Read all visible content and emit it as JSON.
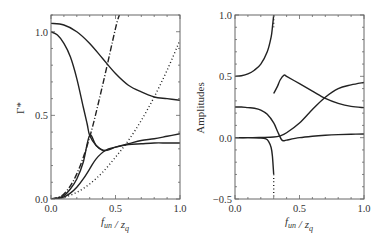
{
  "chart_data": [
    {
      "type": "line",
      "panel": "left",
      "xlabel": "f_un / z_q",
      "ylabel": "Γ*",
      "xlim": [
        0,
        1.0
      ],
      "ylim": [
        0,
        1.1
      ],
      "xticks": [
        "0.0",
        "0.5",
        "1.0"
      ],
      "yticks": [
        "0.0",
        "0.5",
        "1.0"
      ],
      "xtick_values": [
        0,
        0.5,
        1.0
      ],
      "ytick_values": [
        0,
        0.5,
        1.0
      ],
      "grid": false,
      "series": [
        {
          "name": "upper-solid",
          "style": "solid",
          "x": [
            0,
            0.1,
            0.2,
            0.3,
            0.4,
            0.5,
            0.6,
            0.7,
            0.8,
            0.9,
            1.0
          ],
          "y": [
            1.05,
            1.04,
            1.0,
            0.93,
            0.84,
            0.75,
            0.68,
            0.64,
            0.61,
            0.6,
            0.59
          ]
        },
        {
          "name": "falling-solid",
          "style": "solid",
          "x": [
            0,
            0.05,
            0.1,
            0.15,
            0.2,
            0.25,
            0.28,
            0.3,
            0.35,
            0.4,
            0.42
          ],
          "y": [
            1.0,
            0.98,
            0.93,
            0.85,
            0.72,
            0.55,
            0.45,
            0.38,
            0.32,
            0.29,
            0.29
          ]
        },
        {
          "name": "rising-solid-a",
          "style": "solid",
          "x": [
            0,
            0.05,
            0.1,
            0.15,
            0.2,
            0.25,
            0.3,
            0.35,
            0.42,
            0.5,
            0.6,
            0.7,
            0.8,
            0.9,
            1.0
          ],
          "y": [
            0,
            0.005,
            0.02,
            0.06,
            0.12,
            0.22,
            0.38,
            0.32,
            0.29,
            0.31,
            0.33,
            0.35,
            0.36,
            0.375,
            0.39
          ]
        },
        {
          "name": "rising-solid-b",
          "style": "solid",
          "x": [
            0,
            0.05,
            0.1,
            0.15,
            0.2,
            0.25,
            0.3,
            0.35,
            0.42,
            0.5,
            0.6,
            0.7,
            0.8,
            0.9,
            1.0
          ],
          "y": [
            0,
            0.003,
            0.012,
            0.035,
            0.07,
            0.12,
            0.18,
            0.24,
            0.29,
            0.31,
            0.325,
            0.33,
            0.335,
            0.335,
            0.335
          ]
        },
        {
          "name": "dash-dot",
          "style": "dashdot",
          "x": [
            0,
            0.1,
            0.2,
            0.3,
            0.4,
            0.5,
            0.53
          ],
          "y": [
            0,
            0.03,
            0.15,
            0.37,
            0.68,
            1.02,
            1.1
          ]
        },
        {
          "name": "dotted",
          "style": "dotted",
          "x": [
            0,
            0.1,
            0.2,
            0.3,
            0.4,
            0.5,
            0.6,
            0.7,
            0.8,
            0.9,
            1.0
          ],
          "y": [
            0,
            0.01,
            0.04,
            0.09,
            0.16,
            0.25,
            0.35,
            0.47,
            0.61,
            0.77,
            0.95
          ]
        }
      ]
    },
    {
      "type": "line",
      "panel": "right",
      "xlabel": "f_un / z_q",
      "ylabel": "Amplitudes",
      "xlim": [
        0,
        1.0
      ],
      "ylim": [
        -0.5,
        1.0
      ],
      "xticks": [
        "0.0",
        "0.5",
        "1.0"
      ],
      "yticks": [
        "−0.5",
        "0.0",
        "0.5",
        "1.0"
      ],
      "xtick_values": [
        0,
        0.5,
        1.0
      ],
      "ytick_values": [
        -0.5,
        0,
        0.5,
        1.0
      ],
      "grid": false,
      "series": [
        {
          "name": "upper-diverging",
          "style": "solid",
          "x": [
            0,
            0.05,
            0.1,
            0.15,
            0.2,
            0.25,
            0.28,
            0.29,
            0.3
          ],
          "y": [
            0.5,
            0.505,
            0.52,
            0.55,
            0.6,
            0.7,
            0.82,
            0.9,
            1.0
          ]
        },
        {
          "name": "upper-diverging-dotted",
          "style": "dotted",
          "x": [
            0.3,
            0.3
          ],
          "y": [
            0.9,
            1.0
          ]
        },
        {
          "name": "lower-diverging",
          "style": "solid",
          "x": [
            0,
            0.1,
            0.2,
            0.24,
            0.26,
            0.28,
            0.29,
            0.3
          ],
          "y": [
            0,
            0,
            -0.003,
            -0.01,
            -0.03,
            -0.08,
            -0.15,
            -0.3
          ]
        },
        {
          "name": "lower-diverging-dotted",
          "style": "dotted",
          "x": [
            0.3,
            0.3
          ],
          "y": [
            -0.3,
            -0.5
          ]
        },
        {
          "name": "peak-curve",
          "style": "solid",
          "x": [
            0.3,
            0.33,
            0.35,
            0.38,
            0.4,
            0.5,
            0.6,
            0.7,
            0.8,
            0.9,
            1.0
          ],
          "y": [
            0.36,
            0.42,
            0.47,
            0.51,
            0.5,
            0.44,
            0.38,
            0.32,
            0.28,
            0.255,
            0.245
          ]
        },
        {
          "name": "decay-curve",
          "style": "solid",
          "x": [
            0,
            0.05,
            0.1,
            0.15,
            0.2,
            0.25,
            0.3,
            0.33,
            0.36,
            0.38,
            0.4,
            0.5,
            0.6,
            0.7,
            0.8,
            0.9,
            1.0
          ],
          "y": [
            0.25,
            0.25,
            0.245,
            0.24,
            0.225,
            0.19,
            0.12,
            0.05,
            -0.015,
            -0.025,
            -0.02,
            0.0,
            0.012,
            0.02,
            0.025,
            0.028,
            0.03
          ]
        },
        {
          "name": "rising-curve",
          "style": "solid",
          "x": [
            0,
            0.1,
            0.2,
            0.3,
            0.35,
            0.4,
            0.5,
            0.6,
            0.7,
            0.8,
            0.9,
            1.0
          ],
          "y": [
            0,
            0,
            0.002,
            0.005,
            0.015,
            0.04,
            0.12,
            0.23,
            0.33,
            0.4,
            0.43,
            0.45
          ]
        }
      ]
    }
  ]
}
